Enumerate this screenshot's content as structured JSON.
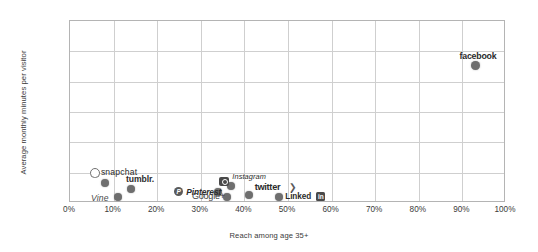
{
  "chart_data": {
    "type": "scatter",
    "title": "",
    "xlabel": "Reach among age 35+",
    "ylabel": "Average monthly minutes per visitor",
    "xlim": [
      0,
      100
    ],
    "ylim": [
      0,
      1200
    ],
    "grid": true,
    "legend": "none",
    "x_ticks": [
      "0%",
      "10%",
      "20%",
      "30%",
      "40%",
      "50%",
      "60%",
      "70%",
      "80%",
      "90%",
      "100%"
    ],
    "y_ticks": [
      "0",
      "200",
      "400",
      "600",
      "800",
      "1,000",
      "1,200"
    ],
    "x_tick_values": [
      0,
      10,
      20,
      30,
      40,
      50,
      60,
      70,
      80,
      90,
      100
    ],
    "y_tick_values": [
      0,
      200,
      400,
      600,
      800,
      1000,
      1200
    ],
    "points": [
      {
        "label": "snapchat",
        "icon": "snapchat-ghost-icon",
        "x": 8,
        "y": 130,
        "label_pos": "above-right"
      },
      {
        "label": "Vine",
        "icon": "",
        "x": 11,
        "y": 40,
        "label_pos": "left"
      },
      {
        "label": "tumblr.",
        "icon": "",
        "x": 14,
        "y": 90,
        "label_pos": "above"
      },
      {
        "label": "Pinterest",
        "icon": "pinterest-p-icon",
        "x": 34,
        "y": 75,
        "label_pos": "left"
      },
      {
        "label": "Google+",
        "icon": "",
        "x": 36,
        "y": 40,
        "label_pos": "left"
      },
      {
        "label": "Instagram",
        "icon": "instagram-camera-icon",
        "x": 37,
        "y": 115,
        "label_pos": "above-right"
      },
      {
        "label": "twitter",
        "icon": "twitter-bird-icon",
        "x": 41,
        "y": 55,
        "label_pos": "above-right"
      },
      {
        "label": "LinkedIn",
        "icon": "linkedin-in-icon",
        "x": 48,
        "y": 40,
        "label_pos": "right"
      },
      {
        "label": "facebook",
        "icon": "",
        "x": 93,
        "y": 905,
        "label_pos": "above"
      }
    ]
  },
  "axes": {
    "x_title": "Reach among age 35+",
    "y_title": "Average monthly minutes per visitor"
  },
  "labels": {
    "snapchat": "snapchat",
    "vine": "Vine",
    "tumblr": "tumblr.",
    "pinterest": "Pinterest",
    "googleplus": "Google+",
    "instagram": "Instagram",
    "twitter": "twitter",
    "linkedin": "Linked",
    "linkedin_badge": "in",
    "facebook": "facebook",
    "pinterest_badge": "P",
    "twitter_bird": "❯"
  },
  "colors": {
    "point": "#6e6e6e",
    "grid": "#cfcfcf",
    "frame": "#b4b4b4",
    "text": "#333333",
    "background": "#ffffff"
  }
}
